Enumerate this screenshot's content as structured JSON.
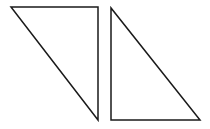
{
  "diagram": {
    "stroke_color": "#1a1a1a",
    "background": "#ffffff",
    "shapes": [
      {
        "name": "left-triangle",
        "type": "right-triangle",
        "points": "11,7 98,7 98,120"
      },
      {
        "name": "right-triangle",
        "type": "right-triangle",
        "points": "111,8 111,120 200,120"
      }
    ]
  }
}
